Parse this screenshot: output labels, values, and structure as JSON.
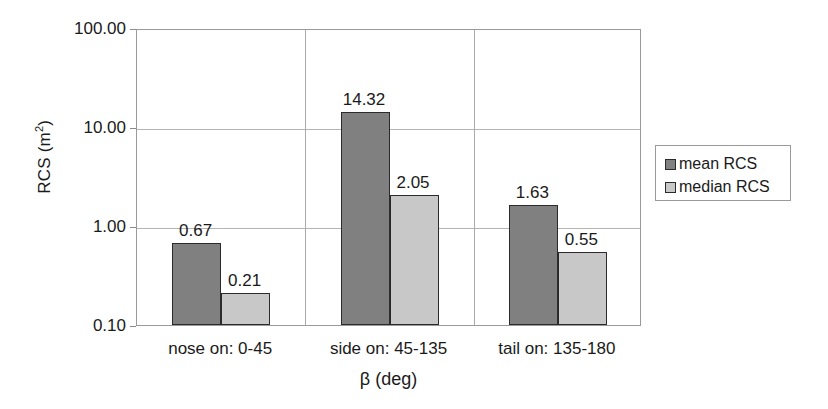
{
  "chart_data": {
    "type": "bar",
    "title": "",
    "xlabel": "β (deg)",
    "ylabel": "RCS (m²)",
    "yscale": "log",
    "ylim": [
      0.1,
      100.0
    ],
    "ytick_labels": [
      "100.00",
      "10.00",
      "1.00",
      "0.10"
    ],
    "ytick_values": [
      100.0,
      10.0,
      1.0,
      0.1
    ],
    "grid": "horizontal",
    "legend_position": "right",
    "categories": [
      "nose on:  0-45",
      "side on: 45-135",
      "tail on: 135-180"
    ],
    "series": [
      {
        "name": "mean RCS",
        "color": "#808080",
        "values": [
          0.67,
          14.32,
          1.63
        ],
        "labels": [
          "0.67",
          "14.32",
          "1.63"
        ]
      },
      {
        "name": "median RCS",
        "color": "#c8c8c8",
        "values": [
          0.21,
          2.05,
          0.55
        ],
        "labels": [
          "0.21",
          "2.05",
          "0.55"
        ]
      }
    ]
  },
  "axes": {
    "y_title": "RCS (m",
    "y_title_sup": "2",
    "y_title_close": ")",
    "x_title": "β (deg)",
    "ticks": [
      {
        "label": "100.00",
        "value": 100.0
      },
      {
        "label": "10.00",
        "value": 10.0
      },
      {
        "label": "1.00",
        "value": 1.0
      },
      {
        "label": "0.10",
        "value": 0.1
      }
    ]
  },
  "categories": [
    {
      "label": "nose on:  0-45"
    },
    {
      "label": "side on: 45-135"
    },
    {
      "label": "tail on: 135-180"
    }
  ],
  "legend": {
    "items": [
      {
        "label": "mean RCS",
        "color": "#808080"
      },
      {
        "label": "median RCS",
        "color": "#c8c8c8"
      }
    ]
  },
  "bars": [
    {
      "label": "0.67",
      "value": 0.67,
      "series": "mean RCS",
      "color": "#808080"
    },
    {
      "label": "0.21",
      "value": 0.21,
      "series": "median RCS",
      "color": "#c8c8c8"
    },
    {
      "label": "14.32",
      "value": 14.32,
      "series": "mean RCS",
      "color": "#808080"
    },
    {
      "label": "2.05",
      "value": 2.05,
      "series": "median RCS",
      "color": "#c8c8c8"
    },
    {
      "label": "1.63",
      "value": 1.63,
      "series": "mean RCS",
      "color": "#808080"
    },
    {
      "label": "0.55",
      "value": 0.55,
      "series": "median RCS",
      "color": "#c8c8c8"
    }
  ],
  "colors": {
    "mean_rcs": "#808080",
    "median_rcs": "#c8c8c8",
    "frame": "#9a9a9a",
    "gridline": "#b4b4b4",
    "bar_outline": "#2b2b2b",
    "text": "#1a1a1a"
  }
}
